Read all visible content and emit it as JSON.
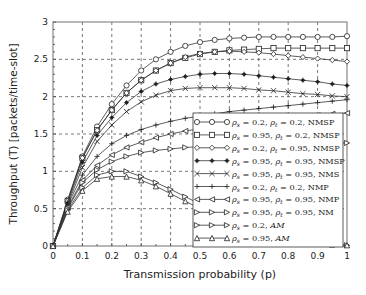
{
  "chart_data": {
    "type": "line",
    "title": "",
    "xlabel": "Transmission probability (p)",
    "ylabel": "Throughput (T) [packets/time-slot]",
    "xlim": [
      0,
      1
    ],
    "ylim": [
      0,
      3
    ],
    "xticks": [
      "0",
      "0.1",
      "0.2",
      "0.3",
      "0.4",
      "0.5",
      "0.6",
      "0.7",
      "0.8",
      "0.9",
      "1"
    ],
    "yticks": [
      "0",
      "0.5",
      "1",
      "1.5",
      "2",
      "2.5",
      "3"
    ],
    "grid": true,
    "legend_position": "lower right",
    "x": [
      0,
      0.05,
      0.1,
      0.15,
      0.2,
      0.25,
      0.3,
      0.35,
      0.4,
      0.45,
      0.5,
      0.55,
      0.6,
      0.65,
      0.7,
      0.75,
      0.8,
      0.85,
      0.9,
      0.95,
      1.0
    ],
    "series": [
      {
        "name": "ρs = 0.2, ρt = 0.2, NMSP",
        "marker": "circle",
        "values": [
          0,
          0.62,
          1.2,
          1.6,
          1.9,
          2.15,
          2.35,
          2.5,
          2.6,
          2.68,
          2.73,
          2.76,
          2.78,
          2.79,
          2.8,
          2.8,
          2.8,
          2.8,
          2.8,
          2.8,
          2.81
        ]
      },
      {
        "name": "ρs = 0.95, ρt = 0.2, NMSP",
        "marker": "square",
        "values": [
          0,
          0.6,
          1.18,
          1.55,
          1.82,
          2.05,
          2.22,
          2.35,
          2.45,
          2.52,
          2.57,
          2.6,
          2.62,
          2.63,
          2.64,
          2.65,
          2.65,
          2.65,
          2.65,
          2.65,
          2.65
        ]
      },
      {
        "name": "ρs = 0.2, ρt = 0.95, NMSP",
        "marker": "diamond",
        "values": [
          0,
          0.6,
          1.18,
          1.55,
          1.82,
          2.05,
          2.22,
          2.35,
          2.45,
          2.53,
          2.58,
          2.6,
          2.61,
          2.6,
          2.59,
          2.57,
          2.55,
          2.53,
          2.51,
          2.49,
          2.47
        ]
      },
      {
        "name": "ρs = 0.95, ρt = 0.95, NMSP",
        "marker": "star",
        "values": [
          0,
          0.58,
          1.12,
          1.48,
          1.72,
          1.92,
          2.07,
          2.17,
          2.23,
          2.27,
          2.3,
          2.31,
          2.31,
          2.3,
          2.28,
          2.26,
          2.24,
          2.22,
          2.2,
          2.17,
          2.15
        ]
      },
      {
        "name": "ρs = 0.95, ρt = 0.95, NMS",
        "marker": "x",
        "values": [
          0,
          0.56,
          1.05,
          1.4,
          1.62,
          1.8,
          1.93,
          2.02,
          2.08,
          2.11,
          2.12,
          2.12,
          2.12,
          2.11,
          2.09,
          2.08,
          2.06,
          2.04,
          2.03,
          2.01,
          2.0
        ]
      },
      {
        "name": "ρs = 0.2, ρt = 0.2, NMP",
        "marker": "plus",
        "values": [
          0,
          0.55,
          0.95,
          1.2,
          1.37,
          1.48,
          1.56,
          1.62,
          1.67,
          1.71,
          1.74,
          1.77,
          1.8,
          1.82,
          1.84,
          1.86,
          1.88,
          1.9,
          1.92,
          1.94,
          1.96
        ]
      },
      {
        "name": "ρs = 0.95, ρt = 0.95, NMP",
        "marker": "triangle-left",
        "values": [
          0,
          0.52,
          0.88,
          1.08,
          1.22,
          1.32,
          1.39,
          1.45,
          1.5,
          1.54,
          1.57,
          1.6,
          1.63,
          1.65,
          1.67,
          1.69,
          1.71,
          1.73,
          1.75,
          1.77,
          1.78
        ]
      },
      {
        "name": "ρs = 0.95, ρt = 0.95, NM",
        "marker": "triangle-right",
        "values": [
          0,
          0.5,
          0.85,
          1.02,
          1.13,
          1.2,
          1.25,
          1.28,
          1.3,
          1.32,
          1.33,
          1.34,
          1.35,
          1.36,
          1.36,
          1.37,
          1.37,
          1.38,
          1.38,
          1.38,
          1.38
        ]
      },
      {
        "name": "ρs = 0.2, AM",
        "marker": "triangle-right",
        "values": [
          0,
          0.48,
          0.78,
          0.95,
          1.0,
          1.0,
          0.93,
          0.85,
          0.76,
          0.66,
          0.56,
          0.47,
          0.38,
          0.3,
          0.23,
          0.17,
          0.12,
          0.08,
          0.05,
          0.02,
          0.01
        ]
      },
      {
        "name": "ρs = 0.95, AM",
        "marker": "triangle-up",
        "values": [
          0,
          0.46,
          0.74,
          0.9,
          0.93,
          0.93,
          0.88,
          0.8,
          0.7,
          0.6,
          0.5,
          0.41,
          0.33,
          0.26,
          0.19,
          0.14,
          0.1,
          0.06,
          0.04,
          0.02,
          0.01
        ]
      }
    ]
  },
  "legend": {
    "entries": [
      {
        "rho_s": "0.2",
        "rho_t": "0.2",
        "scheme": "NMSP"
      },
      {
        "rho_s": "0.95",
        "rho_t": "0.2",
        "scheme": "NMSP"
      },
      {
        "rho_s": "0.2",
        "rho_t": "0.95",
        "scheme": "NMSP"
      },
      {
        "rho_s": "0.95",
        "rho_t": "0.95",
        "scheme": "NMSP"
      },
      {
        "rho_s": "0.95",
        "rho_t": "0.95",
        "scheme": "NMS"
      },
      {
        "rho_s": "0.2",
        "rho_t": "0.2",
        "scheme": "NMP"
      },
      {
        "rho_s": "0.95",
        "rho_t": "0.95",
        "scheme": "NMP"
      },
      {
        "rho_s": "0.95",
        "rho_t": "0.95",
        "scheme": "NM"
      },
      {
        "rho_s": "0.2",
        "rho_t": null,
        "scheme": "AM"
      },
      {
        "rho_s": "0.95",
        "rho_t": null,
        "scheme": "AM"
      }
    ]
  },
  "colors": {
    "line": "#333333",
    "grid": "#555555",
    "axis": "#888888",
    "background": "#ffffff"
  }
}
